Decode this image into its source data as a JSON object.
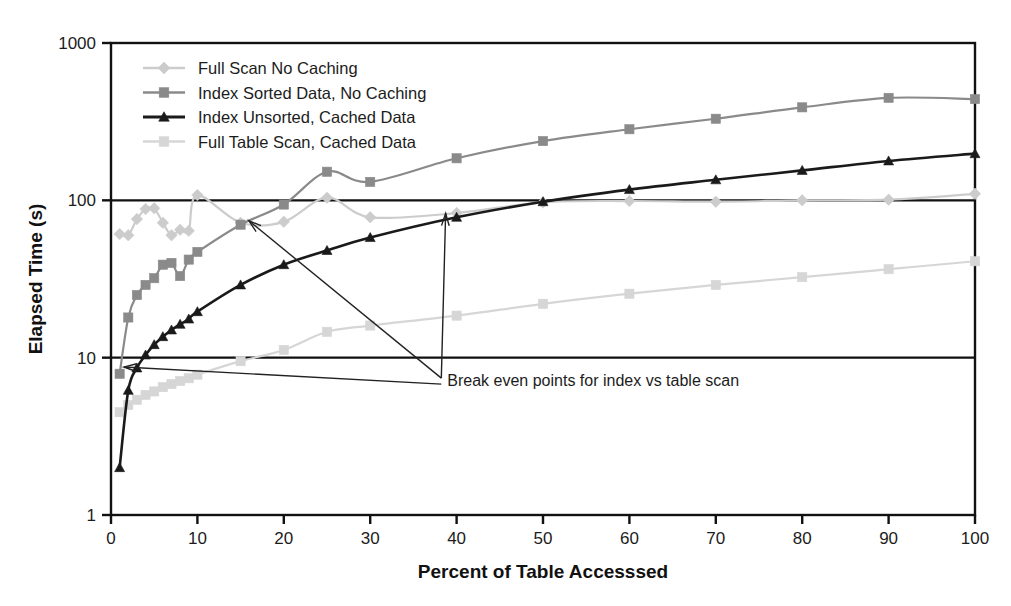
{
  "chart_data": {
    "type": "line",
    "title": "",
    "xlabel": "Percent of Table Accesssed",
    "ylabel": "Elapsed Time (s)",
    "xlim": [
      0,
      100
    ],
    "ylim": [
      1,
      1000
    ],
    "yscale": "log",
    "grid": false,
    "legend_position": "top-left",
    "xticks": [
      "0",
      "10",
      "20",
      "30",
      "40",
      "50",
      "60",
      "70",
      "80",
      "90",
      "100"
    ],
    "yticks": [
      "1",
      "10",
      "100",
      "1000"
    ],
    "annotations": [
      {
        "text": "Break even points for index vs table scan",
        "x": 38,
        "y": 7.2,
        "targets": [
          [
            15.5,
            72
          ],
          [
            38.5,
            78
          ]
        ]
      }
    ],
    "series": [
      {
        "name": "Full Scan No Caching",
        "color": "#cccccc",
        "marker": "diamond",
        "x": [
          1,
          2,
          3,
          4,
          5,
          6,
          7,
          8,
          9,
          10,
          15,
          20,
          25,
          30,
          40,
          50,
          60,
          70,
          80,
          90,
          100
        ],
        "values": [
          61,
          60,
          76,
          88,
          89,
          72,
          60,
          65,
          64,
          108,
          72,
          73,
          104,
          78,
          83,
          97,
          99,
          98,
          100,
          101,
          110
        ]
      },
      {
        "name": "Index Sorted Data, No Caching",
        "color": "#8a8a8a",
        "marker": "square",
        "x": [
          1,
          2,
          3,
          4,
          5,
          6,
          7,
          8,
          9,
          10,
          15,
          20,
          25,
          30,
          40,
          50,
          60,
          70,
          80,
          90,
          100
        ],
        "values": [
          7.9,
          18,
          25,
          29,
          32,
          39,
          40,
          33,
          42,
          47,
          70,
          94,
          152,
          131,
          185,
          238,
          283,
          330,
          390,
          448,
          440
        ]
      },
      {
        "name": "Index Unsorted, Cached Data",
        "color": "#1a1a1a",
        "marker": "triangle",
        "x": [
          1,
          2,
          3,
          4,
          5,
          6,
          7,
          8,
          9,
          10,
          15,
          20,
          25,
          30,
          40,
          50,
          60,
          70,
          80,
          90,
          100
        ],
        "values": [
          2.0,
          6.2,
          8.6,
          10.4,
          12.1,
          13.6,
          15.0,
          16.3,
          17.6,
          19.6,
          29,
          39,
          48,
          58,
          78,
          98,
          117,
          135,
          155,
          178,
          198
        ]
      },
      {
        "name": "Full Table Scan, Cached Data",
        "color": "#d6d6d6",
        "marker": "square",
        "x": [
          1,
          2,
          3,
          4,
          5,
          6,
          7,
          8,
          9,
          10,
          15,
          20,
          25,
          30,
          40,
          50,
          60,
          70,
          80,
          90,
          100
        ],
        "values": [
          4.5,
          5.0,
          5.4,
          5.8,
          6.1,
          6.5,
          6.8,
          7.1,
          7.4,
          7.8,
          9.5,
          11.2,
          14.6,
          16.0,
          18.5,
          22.0,
          25.5,
          29.0,
          32.5,
          36.5,
          41.0
        ]
      }
    ]
  }
}
